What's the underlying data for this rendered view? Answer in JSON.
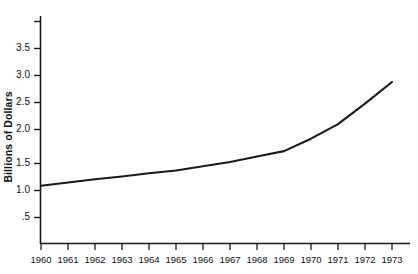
{
  "chart_data": {
    "type": "line",
    "title": "",
    "subtitle": "",
    "xlabel": "",
    "ylabel": "Billions of Dollars",
    "x": [
      1960,
      1961,
      1962,
      1963,
      1964,
      1965,
      1966,
      1967,
      1968,
      1969,
      1970,
      1971,
      1972,
      1973
    ],
    "values": [
      1.08,
      1.14,
      1.2,
      1.25,
      1.31,
      1.36,
      1.44,
      1.52,
      1.62,
      1.72,
      1.95,
      2.22,
      2.6,
      3.0
    ],
    "series": [
      {
        "name": "Billions of Dollars",
        "values": [
          1.08,
          1.14,
          1.2,
          1.25,
          1.31,
          1.36,
          1.44,
          1.52,
          1.62,
          1.72,
          1.95,
          2.22,
          2.6,
          3.0
        ]
      }
    ],
    "categories": [
      "1960",
      "1961",
      "1962",
      "1963",
      "1964",
      "1965",
      "1966",
      "1967",
      "1968",
      "1969",
      "1970",
      "1971",
      "1972",
      "1973"
    ],
    "xlim": [
      1960,
      1973
    ],
    "ylim": [
      0,
      4.0
    ],
    "ytick_values": [
      0.5,
      1.0,
      1.5,
      2.0,
      2.5,
      3.0,
      3.5,
      4.0
    ],
    "ytick_labels": [
      ".5",
      "1.0",
      "1.5",
      "2.0",
      "2.5",
      "3.0",
      "3.5",
      ""
    ],
    "xtick_labels": [
      "1960",
      "1961",
      "1962",
      "1963",
      "1964",
      "1965",
      "1966",
      "1967",
      "1968",
      "1969",
      "1970",
      "1971",
      "1972",
      "1973"
    ],
    "grid": false,
    "legend": false,
    "legend_position": "none",
    "line_color": "#1a1a1a",
    "axis_color": "#1a1a1a",
    "background_color": "#ffffff",
    "annotations": []
  },
  "axis": {
    "y_title": "Billions of Dollars"
  },
  "yticks": [
    {
      "label": "3.5"
    },
    {
      "label": "3.0"
    },
    {
      "label": "2.5"
    },
    {
      "label": "2.0"
    },
    {
      "label": "1.5"
    },
    {
      "label": "1.0"
    },
    {
      "label": ".5"
    }
  ],
  "xticks": [
    {
      "label": "1960"
    },
    {
      "label": "1961"
    },
    {
      "label": "1962"
    },
    {
      "label": "1963"
    },
    {
      "label": "1964"
    },
    {
      "label": "1965"
    },
    {
      "label": "1966"
    },
    {
      "label": "1967"
    },
    {
      "label": "1968"
    },
    {
      "label": "1969"
    },
    {
      "label": "1970"
    },
    {
      "label": "1971"
    },
    {
      "label": "1972"
    },
    {
      "label": "1973"
    }
  ]
}
